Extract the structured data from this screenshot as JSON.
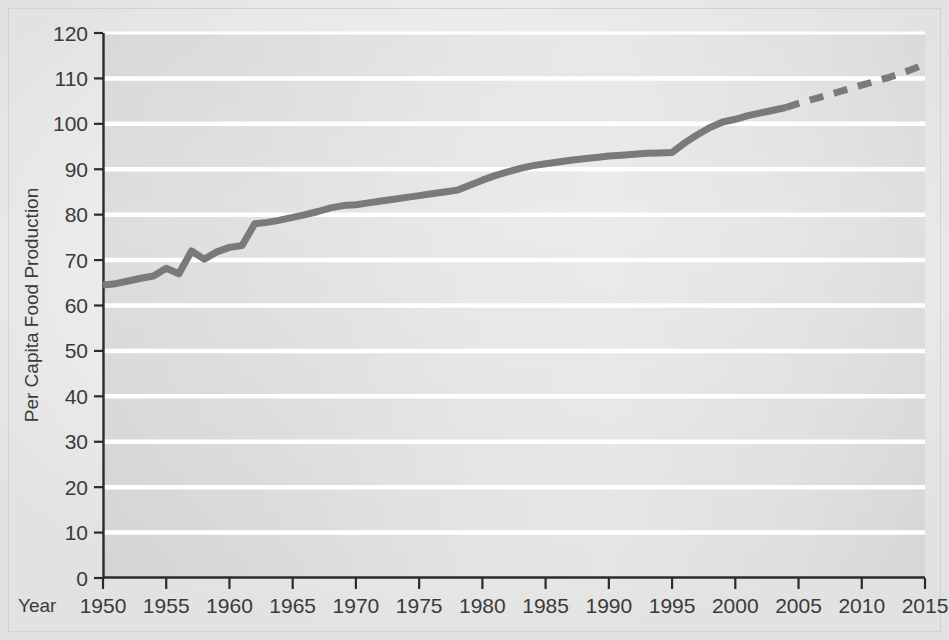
{
  "chart_data": {
    "type": "line",
    "title": "",
    "xlabel": "Year",
    "ylabel": "Per Capita Food Production",
    "xlim": [
      1950,
      2015
    ],
    "ylim": [
      0,
      120
    ],
    "grid": true,
    "legend": "none",
    "x_ticks": [
      1950,
      1955,
      1960,
      1965,
      1970,
      1975,
      1980,
      1985,
      1990,
      1995,
      2000,
      2005,
      2010,
      2015
    ],
    "y_ticks": [
      0,
      10,
      20,
      30,
      40,
      50,
      60,
      70,
      80,
      90,
      100,
      110,
      120
    ],
    "series": [
      {
        "name": "Per capita food production (observed)",
        "style": "solid",
        "color": "#7a7a7a",
        "x": [
          1950,
          1951,
          1952,
          1953,
          1954,
          1955,
          1956,
          1957,
          1958,
          1959,
          1960,
          1961,
          1962,
          1963,
          1964,
          1965,
          1966,
          1967,
          1968,
          1969,
          1970,
          1971,
          1972,
          1973,
          1974,
          1975,
          1976,
          1977,
          1978,
          1979,
          1980,
          1981,
          1982,
          1983,
          1984,
          1985,
          1986,
          1987,
          1988,
          1989,
          1990,
          1991,
          1992,
          1993,
          1994,
          1995,
          1996,
          1997,
          1998,
          1999,
          2000,
          2001,
          2002,
          2003,
          2004
        ],
        "y": [
          64.5,
          64.8,
          65.4,
          66.0,
          66.5,
          68.2,
          67.0,
          72.0,
          70.2,
          71.8,
          72.8,
          73.2,
          78.0,
          78.3,
          78.8,
          79.4,
          80.0,
          80.7,
          81.5,
          82.0,
          82.2,
          82.6,
          83.0,
          83.4,
          83.8,
          84.2,
          84.6,
          85.0,
          85.4,
          86.5,
          87.6,
          88.6,
          89.4,
          90.2,
          90.8,
          91.2,
          91.6,
          92.0,
          92.3,
          92.6,
          92.9,
          93.1,
          93.3,
          93.5,
          93.6,
          93.7,
          95.8,
          97.6,
          99.2,
          100.4,
          101.0,
          101.8,
          102.4,
          103.0,
          103.6
        ]
      },
      {
        "name": "Per capita food production (projected)",
        "style": "dashed",
        "color": "#7a7a7a",
        "x": [
          2004,
          2005,
          2006,
          2007,
          2008,
          2009,
          2010,
          2011,
          2012,
          2013,
          2014,
          2015
        ],
        "y": [
          103.6,
          104.5,
          105.3,
          106.1,
          106.9,
          107.7,
          108.5,
          109.3,
          110.1,
          111.0,
          112.0,
          113.2
        ]
      }
    ],
    "annotations": []
  },
  "axes": {
    "x_caption": "Year",
    "y_title": "Per Capita Food Production"
  },
  "colors": {
    "line": "#7a7a7a",
    "plot_background": "#d9d9d9",
    "gridline": "#ffffff",
    "axis": "#2b2b2b",
    "page_background": "#efefef",
    "tick_text": "#3a3a3a"
  }
}
